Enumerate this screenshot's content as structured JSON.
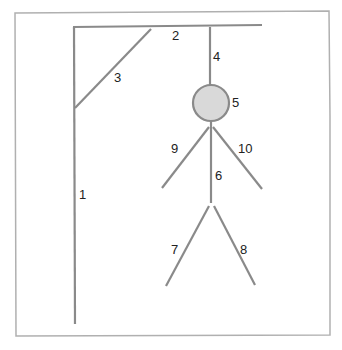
{
  "diagram": {
    "colors": {
      "stroke": "#8a8a8a",
      "head_fill": "#d9d9d9",
      "border": "#b0b0b0",
      "label": "#222222"
    },
    "labels": {
      "pole": "1",
      "beam": "2",
      "brace": "3",
      "rope": "4",
      "head": "5",
      "body": "6",
      "left_leg": "7",
      "right_leg": "8",
      "left_arm": "9",
      "right_arm": "10"
    }
  }
}
